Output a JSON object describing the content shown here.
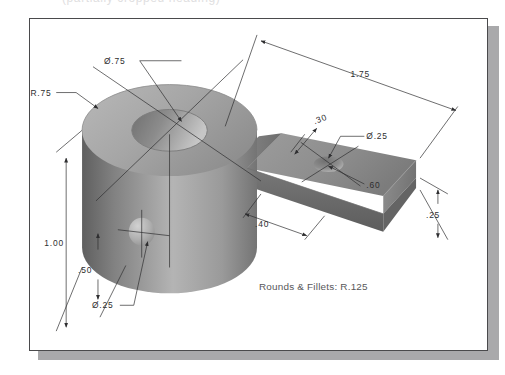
{
  "header": {
    "cropped_title": "(partially cropped heading)"
  },
  "drawing": {
    "note": "Rounds & Fillets: R.125",
    "dimensions": [
      {
        "id": "bore-diameter",
        "label": "Ø.75"
      },
      {
        "id": "boss-radius",
        "label": "R.75"
      },
      {
        "id": "overall-length",
        "label": "1.75"
      },
      {
        "id": "arm-hole-diameter",
        "label": "Ø.25"
      },
      {
        "id": "hole-offset",
        "label": ".30"
      },
      {
        "id": "arm-width",
        "label": ".60"
      },
      {
        "id": "arm-end-distance",
        "label": ".40"
      },
      {
        "id": "arm-thickness",
        "label": ".25"
      },
      {
        "id": "boss-height",
        "label": "1.00"
      },
      {
        "id": "side-hole-height",
        "label": ".50"
      },
      {
        "id": "side-hole-diameter",
        "label": "Ø.25"
      }
    ]
  },
  "colors": {
    "page_background": "#ffffff",
    "page_border": "#4a4a4c",
    "page_shadow": "#a9a9ab",
    "metal_light": "#c9c9c9",
    "metal_mid": "#9a9a9a",
    "metal_dark": "#6e6e6e",
    "line": "#2e2e30",
    "note_text": "#57575a"
  }
}
